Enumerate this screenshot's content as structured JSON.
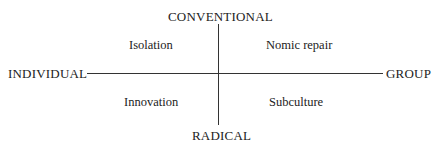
{
  "diagram": {
    "axes": {
      "top": "CONVENTIONAL",
      "bottom": "RADICAL",
      "left": "INDIVIDUAL",
      "right": "GROUP"
    },
    "quadrants": {
      "top_left": "Isolation",
      "top_right": "Nomic repair",
      "bottom_left": "Innovation",
      "bottom_right": "Subculture"
    },
    "colors": {
      "line": "#333333",
      "text": "#222222",
      "background": "#ffffff"
    }
  }
}
